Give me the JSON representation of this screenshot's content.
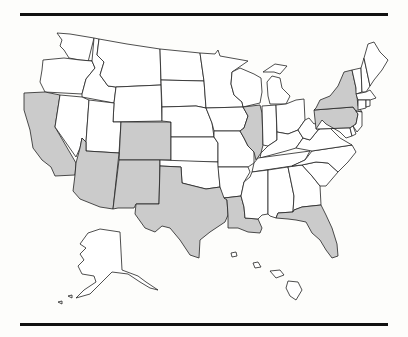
{
  "map": {
    "title": "",
    "colors": {
      "highlighted": "#cbcbcb",
      "default": "#ffffff",
      "border": "#222222",
      "rule": "#111111"
    },
    "highlighted_states": [
      "California",
      "Arizona",
      "Colorado",
      "New Mexico",
      "Texas",
      "Louisiana",
      "Illinois",
      "New York",
      "Pennsylvania",
      "Florida"
    ],
    "states": [
      {
        "id": "WA",
        "name": "Washington",
        "highlighted": false
      },
      {
        "id": "OR",
        "name": "Oregon",
        "highlighted": false
      },
      {
        "id": "CA",
        "name": "California",
        "highlighted": true
      },
      {
        "id": "ID",
        "name": "Idaho",
        "highlighted": false
      },
      {
        "id": "NV",
        "name": "Nevada",
        "highlighted": false
      },
      {
        "id": "MT",
        "name": "Montana",
        "highlighted": false
      },
      {
        "id": "WY",
        "name": "Wyoming",
        "highlighted": false
      },
      {
        "id": "UT",
        "name": "Utah",
        "highlighted": false
      },
      {
        "id": "AZ",
        "name": "Arizona",
        "highlighted": true
      },
      {
        "id": "CO",
        "name": "Colorado",
        "highlighted": true
      },
      {
        "id": "NM",
        "name": "New Mexico",
        "highlighted": true
      },
      {
        "id": "ND",
        "name": "North Dakota",
        "highlighted": false
      },
      {
        "id": "SD",
        "name": "South Dakota",
        "highlighted": false
      },
      {
        "id": "NE",
        "name": "Nebraska",
        "highlighted": false
      },
      {
        "id": "KS",
        "name": "Kansas",
        "highlighted": false
      },
      {
        "id": "OK",
        "name": "Oklahoma",
        "highlighted": false
      },
      {
        "id": "TX",
        "name": "Texas",
        "highlighted": true
      },
      {
        "id": "MN",
        "name": "Minnesota",
        "highlighted": false
      },
      {
        "id": "IA",
        "name": "Iowa",
        "highlighted": false
      },
      {
        "id": "MO",
        "name": "Missouri",
        "highlighted": false
      },
      {
        "id": "AR",
        "name": "Arkansas",
        "highlighted": false
      },
      {
        "id": "LA",
        "name": "Louisiana",
        "highlighted": true
      },
      {
        "id": "WI",
        "name": "Wisconsin",
        "highlighted": false
      },
      {
        "id": "IL",
        "name": "Illinois",
        "highlighted": true
      },
      {
        "id": "MI",
        "name": "Michigan",
        "highlighted": false
      },
      {
        "id": "IN",
        "name": "Indiana",
        "highlighted": false
      },
      {
        "id": "OH",
        "name": "Ohio",
        "highlighted": false
      },
      {
        "id": "KY",
        "name": "Kentucky",
        "highlighted": false
      },
      {
        "id": "TN",
        "name": "Tennessee",
        "highlighted": false
      },
      {
        "id": "MS",
        "name": "Mississippi",
        "highlighted": false
      },
      {
        "id": "AL",
        "name": "Alabama",
        "highlighted": false
      },
      {
        "id": "GA",
        "name": "Georgia",
        "highlighted": false
      },
      {
        "id": "FL",
        "name": "Florida",
        "highlighted": true
      },
      {
        "id": "SC",
        "name": "South Carolina",
        "highlighted": false
      },
      {
        "id": "NC",
        "name": "North Carolina",
        "highlighted": false
      },
      {
        "id": "VA",
        "name": "Virginia",
        "highlighted": false
      },
      {
        "id": "WV",
        "name": "West Virginia",
        "highlighted": false
      },
      {
        "id": "PA",
        "name": "Pennsylvania",
        "highlighted": true
      },
      {
        "id": "NY",
        "name": "New York",
        "highlighted": true
      },
      {
        "id": "NJ",
        "name": "New Jersey",
        "highlighted": false
      },
      {
        "id": "MD",
        "name": "Maryland",
        "highlighted": false
      },
      {
        "id": "DE",
        "name": "Delaware",
        "highlighted": false
      },
      {
        "id": "VT",
        "name": "Vermont",
        "highlighted": false
      },
      {
        "id": "NH",
        "name": "New Hampshire",
        "highlighted": false
      },
      {
        "id": "ME",
        "name": "Maine",
        "highlighted": false
      },
      {
        "id": "MA",
        "name": "Massachusetts",
        "highlighted": false
      },
      {
        "id": "CT",
        "name": "Connecticut",
        "highlighted": false
      },
      {
        "id": "RI",
        "name": "Rhode Island",
        "highlighted": false
      },
      {
        "id": "AK",
        "name": "Alaska",
        "highlighted": false
      },
      {
        "id": "HI",
        "name": "Hawaii",
        "highlighted": false
      }
    ]
  }
}
